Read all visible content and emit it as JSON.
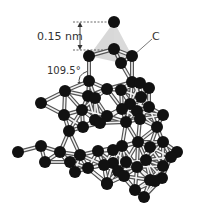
{
  "diagram": {
    "labels": {
      "bond_length": "0.15 nm",
      "bond_angle": "109.5°",
      "atom": "C"
    },
    "colors": {
      "atom": "#111111",
      "bond_outline": "#555555",
      "bond_fill": "#f2f2f2",
      "tetrahedron": "#c8c8c8",
      "label": "#333333"
    },
    "atoms": [
      [
        114,
        22
      ],
      [
        114,
        49
      ],
      [
        89,
        56
      ],
      [
        132,
        56
      ],
      [
        121,
        63
      ],
      [
        89,
        81
      ],
      [
        132,
        82
      ],
      [
        65,
        91
      ],
      [
        88,
        96
      ],
      [
        107,
        89
      ],
      [
        121,
        90
      ],
      [
        140,
        83
      ],
      [
        149,
        88
      ],
      [
        95,
        98
      ],
      [
        130,
        104
      ],
      [
        141,
        97
      ],
      [
        41,
        103
      ],
      [
        64,
        115
      ],
      [
        82,
        110
      ],
      [
        95,
        120
      ],
      [
        107,
        116
      ],
      [
        122,
        109
      ],
      [
        137,
        111
      ],
      [
        149,
        107
      ],
      [
        163,
        115
      ],
      [
        69,
        131
      ],
      [
        83,
        127
      ],
      [
        100,
        123
      ],
      [
        126,
        122
      ],
      [
        140,
        119
      ],
      [
        157,
        127
      ],
      [
        18,
        152
      ],
      [
        41,
        146
      ],
      [
        60,
        152
      ],
      [
        70,
        162
      ],
      [
        80,
        155
      ],
      [
        98,
        151
      ],
      [
        113,
        150
      ],
      [
        122,
        146
      ],
      [
        138,
        142
      ],
      [
        150,
        147
      ],
      [
        163,
        142
      ],
      [
        177,
        152
      ],
      [
        45,
        162
      ],
      [
        88,
        168
      ],
      [
        113,
        163
      ],
      [
        126,
        162
      ],
      [
        146,
        160
      ],
      [
        171,
        157
      ],
      [
        75,
        172
      ],
      [
        104,
        165
      ],
      [
        118,
        171
      ],
      [
        137,
        167
      ],
      [
        163,
        166
      ],
      [
        107,
        183
      ],
      [
        124,
        176
      ],
      [
        150,
        180
      ],
      [
        162,
        178
      ],
      [
        107,
        184
      ],
      [
        135,
        190
      ],
      [
        155,
        181
      ],
      [
        144,
        197
      ]
    ]
  }
}
